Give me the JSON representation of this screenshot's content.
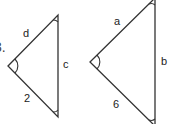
{
  "problem_number": "3.",
  "triangles": [
    {
      "name": "small-triangle",
      "vertices": {
        "left": [
          8,
          66
        ],
        "top": [
          58,
          15
        ],
        "bottom": [
          58,
          117
        ]
      },
      "labels": {
        "upper_side": "d",
        "right_side": "c",
        "lower_side": "2"
      }
    },
    {
      "name": "large-triangle",
      "vertices": {
        "left": [
          90,
          62
        ],
        "top": [
          155,
          -2
        ],
        "bottom": [
          155,
          126
        ]
      },
      "labels": {
        "upper_side": "a",
        "right_side": "b",
        "lower_side": "6"
      }
    }
  ],
  "colors": {
    "stroke": "#333333",
    "background": "#ffffff"
  }
}
